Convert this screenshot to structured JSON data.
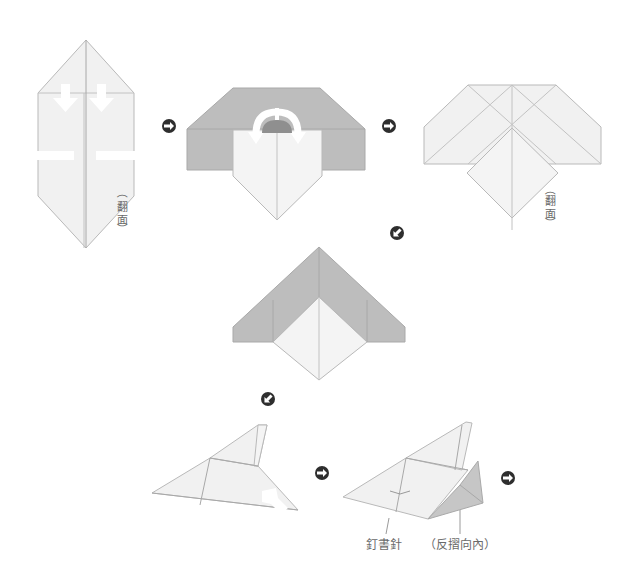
{
  "colors": {
    "paper": "#f1f1f1",
    "shaded_side": "#bdbdbd",
    "crease": "#c2c2c2",
    "step_arrow": "#2e2e2e",
    "label_text": "#6a6a6a"
  },
  "steps": [
    {
      "id": 1,
      "description": "Kite shape with two downward fold arrows and cut marks",
      "note": "（翻面）"
    },
    {
      "id": 2,
      "description": "Shaded body with white front flap and curved fold arrow",
      "note": ""
    },
    {
      "id": 3,
      "description": "Folded wings with diamond in front",
      "note": "（翻面）"
    },
    {
      "id": 4,
      "description": "Shaded chevron wings with white diamond",
      "note": ""
    },
    {
      "id": 5,
      "description": "Side view airplane with fold-up arrow",
      "note": ""
    },
    {
      "id": 6,
      "description": "Finished airplane with stapled body and reverse-folded tail",
      "labels": [
        "釘書針",
        "（反摺向內）"
      ]
    }
  ],
  "flip_note": {
    "open": "（",
    "line1": "翻",
    "line2": "面",
    "close": "）"
  },
  "labels": {
    "staple": "釘書針",
    "reverse_fold": "（反摺向內）"
  },
  "nav_icons": [
    {
      "name": "step-arrow-right",
      "direction": "right"
    },
    {
      "name": "step-arrow-right",
      "direction": "right"
    },
    {
      "name": "step-arrow-down-left",
      "direction": "down-left"
    },
    {
      "name": "step-arrow-down-left",
      "direction": "down-left"
    },
    {
      "name": "step-arrow-right",
      "direction": "right"
    },
    {
      "name": "step-arrow-right",
      "direction": "right"
    }
  ]
}
